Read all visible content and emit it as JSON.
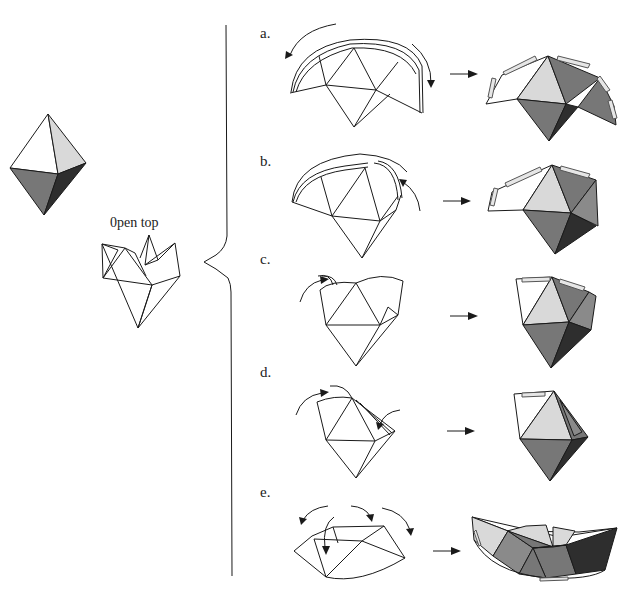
{
  "figure": {
    "type": "origami-folding-diagram",
    "left_panel": {
      "octahedron_label": "",
      "open_top_caption": "0pen top"
    },
    "steps": [
      {
        "id": "a",
        "label": "a."
      },
      {
        "id": "b",
        "label": "b."
      },
      {
        "id": "c",
        "label": "c."
      },
      {
        "id": "d",
        "label": "d."
      },
      {
        "id": "e",
        "label": "e."
      }
    ],
    "colors": {
      "background": "#ffffff",
      "line": "#1a1a1a",
      "light_face": "#d9d9d9",
      "mid_face": "#8a8a8a",
      "dark_face": "#777777",
      "darkest_face": "#2e2e2e"
    }
  }
}
